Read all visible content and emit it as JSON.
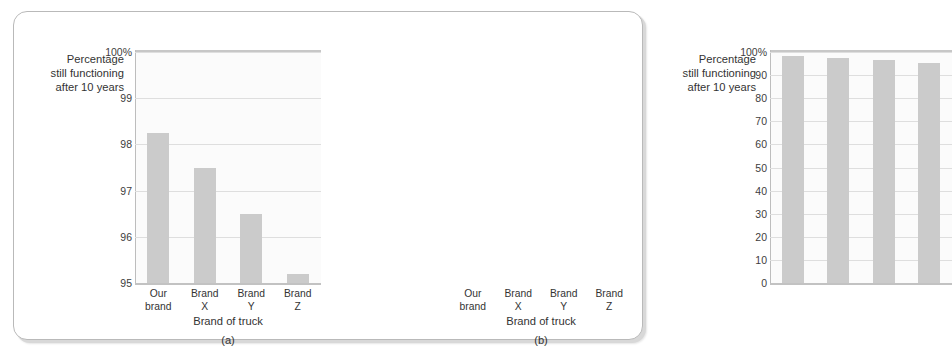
{
  "figure": {
    "accent_bar_color": "#cbcbcb",
    "plot_background": "#fbfbfb",
    "gridline_color": "#dedede",
    "frame_border_color": "#b9b9b9"
  },
  "chart_data": [
    {
      "type": "bar",
      "panel_label": "(a)",
      "title": "",
      "ylabel": "Percentage\nstill functioning\nafter 10 years",
      "xlabel": "Brand of truck",
      "categories": [
        "Our\nbrand",
        "Brand\nX",
        "Brand\nY",
        "Brand\nZ"
      ],
      "values": [
        98.25,
        97.5,
        96.5,
        95.2
      ],
      "ylim": [
        95,
        100
      ],
      "yticks": [
        95,
        96,
        97,
        98,
        99,
        100
      ],
      "yticklabels": [
        "95",
        "96",
        "97",
        "98",
        "99",
        "100%"
      ],
      "grid": true,
      "legend": "none"
    },
    {
      "type": "bar",
      "panel_label": "(b)",
      "title": "",
      "ylabel": "Percentage\nstill functioning\nafter 10 years",
      "xlabel": "Brand of truck",
      "categories": [
        "Our\nbrand",
        "Brand\nX",
        "Brand\nY",
        "Brand\nZ"
      ],
      "values": [
        98.25,
        97.5,
        96.5,
        95.2
      ],
      "ylim": [
        0,
        100
      ],
      "yticks": [
        0,
        10,
        20,
        30,
        40,
        50,
        60,
        70,
        80,
        90,
        100
      ],
      "yticklabels": [
        "0",
        "10",
        "20",
        "30",
        "40",
        "50",
        "60",
        "70",
        "80",
        "90",
        "100%"
      ],
      "grid": true,
      "legend": "none"
    }
  ]
}
